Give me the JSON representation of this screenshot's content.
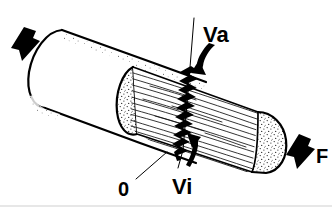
{
  "figure": {
    "kind": "technical-line-drawing",
    "background_color": "#ffffff",
    "ink_color": "#000000",
    "width": 332,
    "height": 210
  },
  "labels": {
    "va": "Va",
    "vi": "Vi",
    "origin": "0",
    "force": "F"
  },
  "annotations": {
    "load_arrow_left": "load-arrow-down-left",
    "load_arrow_right": "load-arrow-down-right",
    "curved_arrow_upper": "curved-arrow-va",
    "curved_arrow_lower": "curved-arrow-vi",
    "fracture": "jagged-crack-line",
    "axis": "vertical-reference-axis",
    "leader": "origin-leader-line"
  }
}
